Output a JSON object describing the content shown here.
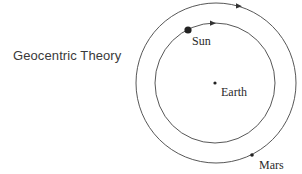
{
  "title": "Geocentric Theory",
  "colors": {
    "stroke": "#333333",
    "text": "#2a2a2a",
    "background": "#ffffff"
  },
  "orbits": [
    {
      "name": "outer-orbit",
      "cx": 216,
      "cy": 83,
      "r": 80,
      "direction": "clockwise"
    },
    {
      "name": "inner-orbit",
      "cx": 215,
      "cy": 83,
      "r": 60,
      "direction": "clockwise"
    }
  ],
  "bodies": [
    {
      "name": "Sun",
      "label": "Sun",
      "x": 188,
      "y": 30,
      "r": 3.6
    },
    {
      "name": "Earth",
      "label": "Earth",
      "x": 215,
      "y": 83,
      "r": 1.6
    },
    {
      "name": "Mars",
      "label": "Mars",
      "x": 252,
      "y": 155,
      "r": 1.8
    }
  ]
}
